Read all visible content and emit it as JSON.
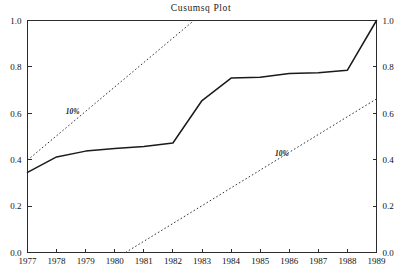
{
  "chart_data": {
    "type": "line",
    "title": "Cusumsq Plot",
    "xlabel": "",
    "ylabel": "",
    "xlim": [
      1977,
      1989
    ],
    "ylim": [
      0.0,
      1.0
    ],
    "grid": false,
    "legend_position": "none",
    "x_tick_labels": [
      "1977",
      "1978",
      "1979",
      "1980",
      "1981",
      "1982",
      "1983",
      "1984",
      "1985",
      "1986",
      "1987",
      "1988",
      "1989"
    ],
    "y_tick_labels": [
      "0.0",
      "0.2",
      "0.4",
      "0.6",
      "0.8",
      "1.0"
    ],
    "y_tick_values": [
      0.0,
      0.2,
      0.4,
      0.6,
      0.8,
      1.0
    ],
    "right_axis_tick_labels": [
      "0.0",
      "0.2",
      "0.4",
      "0.6",
      "0.8",
      "1.0"
    ],
    "x": [
      1977,
      1978,
      1979,
      1980,
      1981,
      1982,
      1983,
      1984,
      1985,
      1986,
      1987,
      1988,
      1989
    ],
    "series": [
      {
        "name": "Cusumsq",
        "style": "solid",
        "color": "#1a1a1a",
        "values": [
          0.345,
          0.412,
          0.437,
          0.448,
          0.457,
          0.472,
          0.655,
          0.752,
          0.755,
          0.772,
          0.775,
          0.786,
          1.0
        ]
      },
      {
        "name": "10% upper band",
        "style": "dotted",
        "color": "#333333",
        "x_endpoints": [
          1977,
          1982.72
        ],
        "y_endpoints": [
          0.398,
          1.0
        ]
      },
      {
        "name": "10% lower band",
        "style": "dotted",
        "color": "#333333",
        "x_endpoints": [
          1980.37,
          1989
        ],
        "y_endpoints": [
          0.0,
          0.662
        ]
      }
    ],
    "annotations": [
      {
        "text": "10%",
        "x": 1978.55,
        "y": 0.595,
        "name": "upper-band-label"
      },
      {
        "text": "10%",
        "x": 1985.75,
        "y": 0.415,
        "name": "lower-band-label"
      }
    ]
  }
}
